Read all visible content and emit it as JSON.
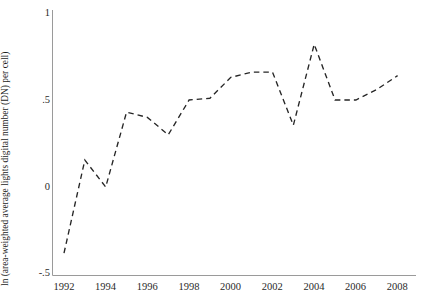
{
  "chart_data": {
    "type": "line",
    "title": "",
    "subtitle": "",
    "xlabel": "",
    "ylabel": "ln (area-weighted average lights digital number (DN) per cell)",
    "xlim": [
      1991.4,
      2008.8
    ],
    "ylim": [
      -0.5,
      1.0
    ],
    "grid": false,
    "legend": null,
    "line_style": "dashed",
    "line_color": "#262626",
    "x_tick_labels": [
      "1992",
      "1994",
      "1996",
      "1998",
      "2000",
      "2002",
      "2004",
      "2006",
      "2008"
    ],
    "x_tick_values": [
      1992,
      1994,
      1996,
      1998,
      2000,
      2002,
      2004,
      2006,
      2008
    ],
    "y_tick_labels": [
      "1",
      ".5",
      "0",
      "-.5"
    ],
    "y_tick_values": [
      1,
      0.5,
      0,
      -0.5
    ],
    "x": [
      1992,
      1993,
      1994,
      1995,
      1996,
      1997,
      1998,
      1999,
      2000,
      2001,
      2002,
      2003,
      2004,
      2005,
      2006,
      2007,
      2008
    ],
    "values": [
      -0.38,
      0.155,
      0.0,
      0.43,
      0.4,
      0.3,
      0.5,
      0.51,
      0.63,
      0.66,
      0.66,
      0.355,
      0.82,
      0.5,
      0.5,
      0.56,
      0.64
    ],
    "series": [
      {
        "name": "ln (area-weighted average lights digital number (DN) per cell)",
        "values": [
          -0.38,
          0.155,
          0.0,
          0.43,
          0.4,
          0.3,
          0.5,
          0.51,
          0.63,
          0.66,
          0.66,
          0.355,
          0.82,
          0.5,
          0.5,
          0.56,
          0.64
        ]
      }
    ]
  },
  "axes": {
    "y_axis_label": "ln (area-weighted average lights digital number (DN) per cell)",
    "y_ticks": [
      {
        "label": "1",
        "value": 1
      },
      {
        "label": ".5",
        "value": 0.5
      },
      {
        "label": "0",
        "value": 0
      },
      {
        "label": "-.5",
        "value": -0.5
      }
    ],
    "x_ticks": [
      {
        "label": "1992",
        "value": 1992
      },
      {
        "label": "1994",
        "value": 1994
      },
      {
        "label": "1996",
        "value": 1996
      },
      {
        "label": "1998",
        "value": 1998
      },
      {
        "label": "2000",
        "value": 2000
      },
      {
        "label": "2002",
        "value": 2002
      },
      {
        "label": "2004",
        "value": 2004
      },
      {
        "label": "2006",
        "value": 2006
      },
      {
        "label": "2008",
        "value": 2008
      }
    ]
  },
  "colors": {
    "line": "#262626",
    "axis": "#8a8a8a",
    "text": "#1c1c1c",
    "background": "#ffffff"
  }
}
